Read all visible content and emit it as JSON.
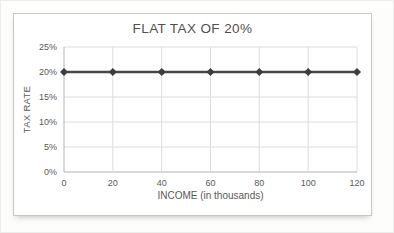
{
  "chart_data": {
    "type": "line",
    "title": "FLAT TAX OF 20%",
    "xlabel": "INCOME (in thousands)",
    "ylabel": "TAX RATE",
    "x": [
      0,
      20,
      40,
      60,
      80,
      100,
      120
    ],
    "series": [
      {
        "name": "flat tax rate",
        "values": [
          20,
          20,
          20,
          20,
          20,
          20,
          20
        ]
      }
    ],
    "xlim": [
      0,
      120
    ],
    "ylim": [
      0,
      25
    ],
    "xticks": [
      0,
      20,
      40,
      60,
      80,
      100,
      120
    ],
    "xtick_labels": [
      "0",
      "20",
      "40",
      "60",
      "80",
      "100",
      "120"
    ],
    "yticks": [
      0,
      5,
      10,
      15,
      20,
      25
    ],
    "ytick_labels": [
      "0%",
      "5%",
      "10%",
      "15%",
      "20%",
      "25%"
    ],
    "grid": true,
    "legend": "none",
    "marker_shape": "diamond",
    "colors": {
      "series_line": "#474747",
      "marker": "#3d3d3d",
      "gridline": "#dcdcda",
      "axis_line": "#b3b3b1",
      "tick_text": "#595959",
      "title_text": "#4f4f4f",
      "frame_border": "#c6c6c4",
      "background": "#ffffff"
    }
  }
}
